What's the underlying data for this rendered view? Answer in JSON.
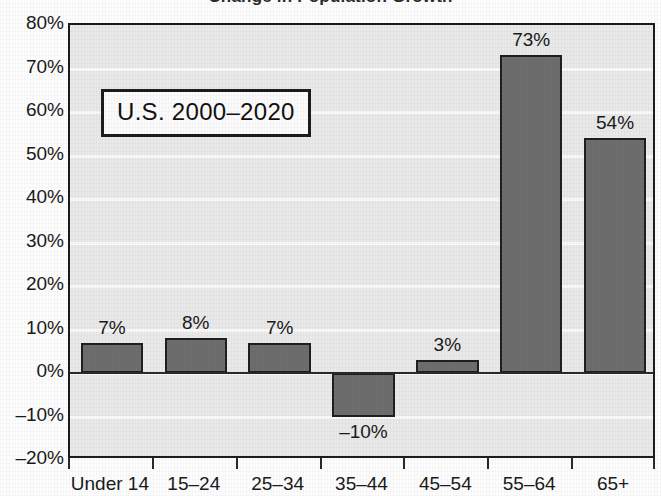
{
  "chart_data": {
    "type": "bar",
    "title": "Change in Population Growth",
    "xlabel": "",
    "ylabel": "",
    "categories": [
      "Under 14",
      "15–24",
      "25–34",
      "35–44",
      "45–54",
      "55–64",
      "65+"
    ],
    "values": [
      7,
      8,
      7,
      -10,
      3,
      73,
      54
    ],
    "value_labels": [
      "7%",
      "8%",
      "7%",
      "–10%",
      "3%",
      "73%",
      "54%"
    ],
    "ylim": [
      -20,
      80
    ],
    "ytick_values": [
      80,
      70,
      60,
      50,
      40,
      30,
      20,
      10,
      0,
      -10,
      -20
    ],
    "ytick_labels": [
      "80%",
      "70%",
      "60%",
      "50%",
      "40%",
      "30%",
      "20%",
      "10%",
      "0%",
      "–10%",
      "–20%"
    ],
    "grid": true,
    "legend": "none",
    "annotation": "U.S. 2000–2020",
    "bar_color": "#6e6e6e",
    "bar_edge_color": "#1f1f1f",
    "plot_background": "#e9e9e9",
    "gridline_color": "#fafafa",
    "axis_color": "#1c1c1c",
    "text_color": "#1a1a1a"
  }
}
